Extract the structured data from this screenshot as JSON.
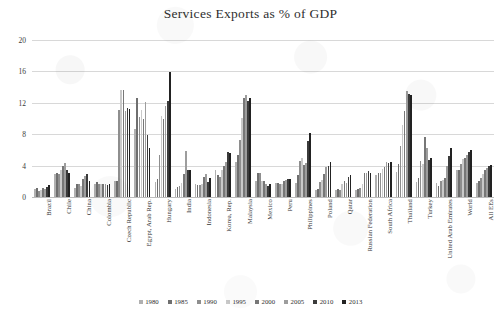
{
  "chart_data": {
    "type": "bar",
    "title": "Services Exports as % of GDP",
    "xlabel": "",
    "ylabel": "",
    "ylim": [
      0,
      20
    ],
    "yticks": [
      0,
      4,
      8,
      12,
      16,
      20
    ],
    "grid": true,
    "legend_position": "bottom",
    "categories": [
      "Brazil",
      "Chile",
      "China",
      "Colombia",
      "Czech Republic",
      "Egypt, Arab Rep.",
      "Hungary",
      "India",
      "Indonesia",
      "Korea, Rep.",
      "Malaysia",
      "Mexico",
      "Peru",
      "Philippines",
      "Poland",
      "Qatar",
      "Russian Federation",
      "South Africa",
      "Thailand",
      "Turkey",
      "United Arab Emirates",
      "World",
      "All EEs"
    ],
    "series": [
      {
        "name": "1980",
        "color": "#b0b0b0",
        "values": [
          1.0,
          2.9,
          1.2,
          1.6,
          2.0,
          8.7,
          1.9,
          1.0,
          1.6,
          3.4,
          4.4,
          2.0,
          1.8,
          1.8,
          0.9,
          0.9,
          0.9,
          2.8,
          3.2,
          1.9,
          1.8,
          3.4,
          1.8
        ]
      },
      {
        "name": "1985",
        "color": "#6f6f6f",
        "values": [
          1.1,
          3.1,
          1.6,
          1.9,
          2.1,
          12.6,
          2.3,
          1.3,
          1.5,
          2.8,
          5.4,
          3.1,
          1.8,
          2.8,
          1.0,
          1.0,
          1.0,
          3.0,
          4.2,
          2.4,
          1.4,
          3.5,
          2.1
        ]
      },
      {
        "name": "1990",
        "color": "#8e8e8e",
        "values": [
          0.8,
          2.9,
          1.6,
          1.6,
          11.1,
          10.2,
          5.4,
          1.4,
          1.5,
          2.6,
          7.3,
          3.0,
          1.7,
          4.6,
          1.9,
          0.9,
          1.1,
          3.0,
          6.5,
          4.6,
          2.0,
          4.2,
          2.4
        ]
      },
      {
        "name": "1995",
        "color": "#c9c9c9",
        "values": [
          0.9,
          3.5,
          1.4,
          1.7,
          13.6,
          11.1,
          10.3,
          1.8,
          1.6,
          3.5,
          10.1,
          2.0,
          1.6,
          5.0,
          2.2,
          1.6,
          1.7,
          3.6,
          9.2,
          4.2,
          2.2,
          4.8,
          2.9
        ]
      },
      {
        "name": "2000",
        "color": "#777777",
        "values": [
          1.1,
          3.9,
          2.3,
          1.7,
          13.6,
          9.9,
          9.9,
          2.9,
          2.6,
          4.0,
          12.6,
          2.1,
          2.0,
          4.1,
          2.9,
          2.0,
          3.1,
          3.8,
          11.0,
          7.6,
          2.4,
          5.0,
          3.4
        ]
      },
      {
        "name": "2005",
        "color": "#9d9d9d",
        "values": [
          1.0,
          4.3,
          2.7,
          1.7,
          11.0,
          12.1,
          11.6,
          5.9,
          2.9,
          4.4,
          13.0,
          1.6,
          2.2,
          4.3,
          3.8,
          1.8,
          3.0,
          4.4,
          13.5,
          6.2,
          4.0,
          5.3,
          3.7
        ]
      },
      {
        "name": "2010",
        "color": "#3b3b3b",
        "values": [
          1.3,
          3.4,
          2.9,
          1.5,
          11.4,
          7.9,
          12.2,
          3.4,
          1.9,
          5.7,
          12.2,
          1.4,
          2.3,
          7.1,
          3.9,
          2.6,
          3.3,
          4.3,
          13.1,
          4.7,
          5.2,
          5.7,
          3.9
        ]
      },
      {
        "name": "2013",
        "color": "#222222",
        "values": [
          1.5,
          3.0,
          2.1,
          1.7,
          11.2,
          6.3,
          15.9,
          3.5,
          2.4,
          5.6,
          12.6,
          1.6,
          2.3,
          8.1,
          4.4,
          2.8,
          3.1,
          4.5,
          13.0,
          5.0,
          6.2,
          6.0,
          4.1
        ]
      }
    ]
  },
  "legend": {
    "entries": [
      "1980",
      "1985",
      "1990",
      "1995",
      "2000",
      "2005",
      "2010",
      "2013"
    ]
  }
}
